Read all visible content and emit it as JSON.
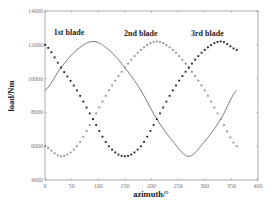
{
  "chart_data": {
    "type": "line",
    "title": "",
    "xlabel": "azimuth/°",
    "ylabel": "load/Nm",
    "xlim": [
      0,
      400
    ],
    "ylim": [
      4000,
      14000
    ],
    "xticks": [
      0,
      50,
      100,
      150,
      200,
      250,
      300,
      350,
      400
    ],
    "yticks": [
      4000,
      6000,
      8000,
      10000,
      12000,
      14000
    ],
    "xtick_labels": [
      "0",
      "50",
      "100",
      "150",
      "200",
      "250",
      "300",
      "350",
      "400"
    ],
    "ytick_labels": [
      "4000",
      "6000",
      "8000",
      "10000",
      "12000",
      "14000"
    ],
    "grid": false,
    "legend": null,
    "annotations": [
      {
        "text": "1st blade",
        "x": 45,
        "y": 12600
      },
      {
        "text": "2nd blade",
        "x": 180,
        "y": 12550
      },
      {
        "text": "3rd blade",
        "x": 305,
        "y": 12550
      }
    ],
    "series": [
      {
        "name": "1st blade",
        "style": "solid",
        "color": "#555555",
        "x": [
          0,
          30,
          60,
          90,
          120,
          150,
          180,
          210,
          240,
          270,
          300,
          330,
          360
        ],
        "values": [
          9300,
          10650,
          11700,
          12200,
          11700,
          10650,
          9300,
          7600,
          6300,
          5400,
          6300,
          7600,
          9300
        ]
      },
      {
        "name": "2nd blade",
        "style": "dotted",
        "color": "#8a8a8a",
        "x": [
          0,
          30,
          60,
          90,
          120,
          150,
          180,
          210,
          240,
          270,
          300,
          330,
          360
        ],
        "values": [
          6000,
          5400,
          6000,
          7600,
          9300,
          10650,
          11700,
          12200,
          11700,
          10650,
          9300,
          7600,
          6000
        ]
      },
      {
        "name": "3rd blade",
        "style": "dotted",
        "color": "#1a1a1a",
        "x": [
          0,
          30,
          60,
          90,
          120,
          150,
          180,
          210,
          240,
          270,
          300,
          330,
          360
        ],
        "values": [
          12000,
          10650,
          9300,
          7600,
          6000,
          5400,
          6000,
          7600,
          9300,
          10650,
          11700,
          12200,
          11700
        ]
      }
    ]
  }
}
